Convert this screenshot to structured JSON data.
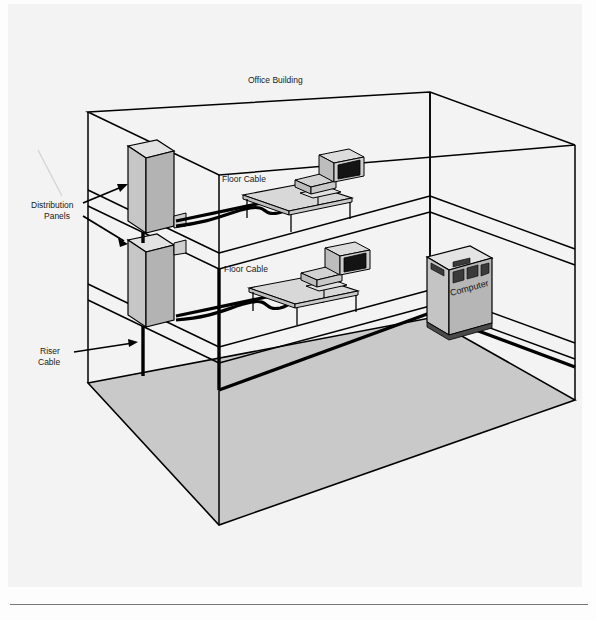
{
  "document": {
    "title": "Office Building",
    "type": "isometric-building-cabling-diagram"
  },
  "diagram": {
    "title": "Office Building",
    "labels": {
      "distribution_panels": "Distribution\nPanels",
      "distribution_panels_line1": "Distribution",
      "distribution_panels_line2": "Panels",
      "riser_cable_line1": "Riser",
      "riser_cable_line2": "Cable",
      "floor_cable_upper": "Floor Cable",
      "floor_cable_lower": "Floor Cable",
      "computer": "Computer"
    },
    "components": [
      {
        "name": "distribution-panel-upper",
        "label": "Distribution Panels",
        "floor": "upper",
        "type": "wall-cabinet"
      },
      {
        "name": "distribution-panel-lower",
        "label": "Distribution Panels",
        "floor": "middle",
        "type": "wall-cabinet"
      },
      {
        "name": "riser-cable",
        "label": "Riser Cable",
        "type": "vertical-backbone-cable"
      },
      {
        "name": "floor-cable-upper",
        "label": "Floor Cable",
        "floor": "upper",
        "type": "horizontal-cable"
      },
      {
        "name": "floor-cable-lower",
        "label": "Floor Cable",
        "floor": "middle",
        "type": "horizontal-cable"
      },
      {
        "name": "workstation-upper",
        "floor": "upper",
        "type": "desk-with-terminal"
      },
      {
        "name": "workstation-lower",
        "floor": "middle",
        "type": "desk-with-terminal"
      },
      {
        "name": "computer-mainframe",
        "label": "Computer",
        "floor": "ground",
        "type": "mainframe-cabinet"
      }
    ],
    "floors": [
      "upper",
      "middle",
      "ground"
    ],
    "colors": {
      "line": "#000000",
      "cable": "#000000",
      "panel_face": "#c6c6c6",
      "panel_side": "#b0b0b0",
      "panel_top": "#e2e2e2",
      "ground_floor": "#c9c9c9",
      "desk_top": "#d8d8d8",
      "monitor_screen": "#111111",
      "computer_face": "#c4c4c4",
      "computer_slot": "#3a3a3a",
      "page_background": "#f3f3f3"
    }
  }
}
